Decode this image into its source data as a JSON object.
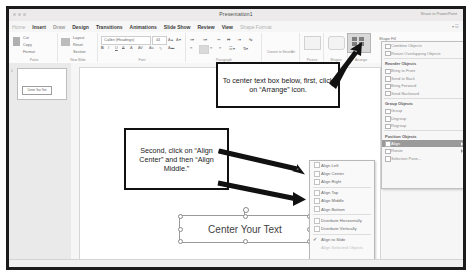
{
  "window": {
    "title": "Presentation1",
    "share_label": "Share in PowerPoint",
    "traffic_light_icons": [
      "close-icon",
      "minimize-icon",
      "maximize-icon"
    ]
  },
  "ribbon": {
    "tabs": [
      {
        "label": "Home",
        "active": false
      },
      {
        "label": "Insert",
        "active": true
      },
      {
        "label": "Draw",
        "active": false
      },
      {
        "label": "Design",
        "active": false
      },
      {
        "label": "Transitions",
        "active": false
      },
      {
        "label": "Animations",
        "active": false
      },
      {
        "label": "Slide Show",
        "active": false
      },
      {
        "label": "Review",
        "active": false
      },
      {
        "label": "View",
        "active": false
      },
      {
        "label": "Shape Format",
        "active": false
      }
    ],
    "right_hint": "ribbon-options",
    "groups": [
      {
        "label": "Paste",
        "items": [
          "Cut",
          "Copy",
          "Format"
        ]
      },
      {
        "label": "New Slide",
        "items": [
          "Layout",
          "Reset",
          "Section"
        ]
      },
      {
        "label": "Font",
        "items": [
          "Calibri (Headings)",
          "44"
        ]
      },
      {
        "label": "Paragraph",
        "items": []
      },
      {
        "label": "Convert to SmartArt",
        "items": []
      },
      {
        "label": "Picture",
        "items": []
      },
      {
        "label": "Shapes",
        "items": []
      },
      {
        "label": "Arrange",
        "items": []
      },
      {
        "label": "Shape Fill",
        "items": []
      }
    ],
    "font_name": "Calibri (Headings)",
    "font_size": "44",
    "shape_fill_label": "Shape Fill",
    "arrange_label": "Arrange"
  },
  "slides_panel": {
    "slide_number": "1",
    "thumb_text": "Center Your Text"
  },
  "slide": {
    "textbox_text": "Center Your Text"
  },
  "callouts": [
    {
      "id": "callout-1",
      "text": "To center text box below, first, click on “Arrange” icon."
    },
    {
      "id": "callout-2",
      "text": "Second, click on “Align Center” and then “Align Middle.”"
    }
  ],
  "arrange_panel": {
    "sections": [
      {
        "heading": "",
        "items": [
          {
            "label": "Combine Objects",
            "state": "disabled",
            "submenu": false
          },
          {
            "label": "Resize Overlapping Objects",
            "state": "disabled",
            "submenu": false
          }
        ]
      },
      {
        "heading": "Reorder Objects",
        "items": [
          {
            "label": "Bring to Front",
            "state": "disabled",
            "submenu": false
          },
          {
            "label": "Send to Back",
            "state": "disabled",
            "submenu": false
          },
          {
            "label": "Bring Forward",
            "state": "disabled",
            "submenu": false
          },
          {
            "label": "Send Backward",
            "state": "disabled",
            "submenu": false
          }
        ]
      },
      {
        "heading": "Group Objects",
        "items": [
          {
            "label": "Group",
            "state": "disabled",
            "submenu": false
          },
          {
            "label": "Ungroup",
            "state": "disabled",
            "submenu": false
          },
          {
            "label": "Regroup",
            "state": "disabled",
            "submenu": false
          }
        ]
      },
      {
        "heading": "Position Objects",
        "items": [
          {
            "label": "Align",
            "state": "selected",
            "submenu": true
          },
          {
            "label": "Rotate",
            "state": "normal",
            "submenu": true
          },
          {
            "label": "Selection Pane...",
            "state": "normal",
            "submenu": false
          }
        ]
      }
    ]
  },
  "align_menu": {
    "groups": [
      [
        {
          "label": "Align Left",
          "icon": "align-left-icon",
          "checked": false,
          "disabled": false
        },
        {
          "label": "Align Center",
          "icon": "align-center-icon",
          "checked": false,
          "disabled": false
        },
        {
          "label": "Align Right",
          "icon": "align-right-icon",
          "checked": false,
          "disabled": false
        }
      ],
      [
        {
          "label": "Align Top",
          "icon": "align-top-icon",
          "checked": false,
          "disabled": false
        },
        {
          "label": "Align Middle",
          "icon": "align-middle-icon",
          "checked": false,
          "disabled": false
        },
        {
          "label": "Align Bottom",
          "icon": "align-bottom-icon",
          "checked": false,
          "disabled": false
        }
      ],
      [
        {
          "label": "Distribute Horizontally",
          "icon": "distribute-horizontal-icon",
          "checked": false,
          "disabled": false
        },
        {
          "label": "Distribute Vertically",
          "icon": "distribute-vertical-icon",
          "checked": false,
          "disabled": false
        }
      ],
      [
        {
          "label": "Align to Slide",
          "icon": "check-icon",
          "checked": true,
          "disabled": false
        },
        {
          "label": "Align Selected Objects",
          "icon": "none",
          "checked": false,
          "disabled": true
        }
      ]
    ]
  },
  "colors": {
    "frame": "#1b1b1b",
    "callout_border": "#111111",
    "arrow": "#111111",
    "selected_menu": "#9a9a9a",
    "ribbon_bg": "#fbfbfb"
  }
}
